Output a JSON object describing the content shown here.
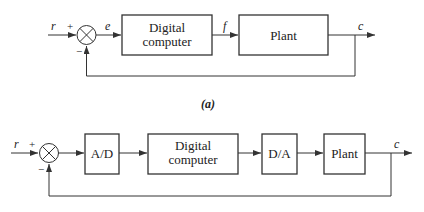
{
  "diagram_a": {
    "caption": "(a)",
    "input_label": "r",
    "plus_sign": "+",
    "minus_sign": "−",
    "error_label": "e",
    "block1_line1": "Digital",
    "block1_line2": "computer",
    "signal_f": "f",
    "block2": "Plant",
    "output_label": "c"
  },
  "diagram_b": {
    "input_label": "r",
    "plus_sign": "+",
    "minus_sign": "−",
    "block_ad": "A/D",
    "block_dc_line1": "Digital",
    "block_dc_line2": "computer",
    "block_da": "D/A",
    "block_plant": "Plant",
    "output_label": "c"
  },
  "colors": {
    "line": "#333333",
    "text": "#222222",
    "background": "#ffffff"
  }
}
